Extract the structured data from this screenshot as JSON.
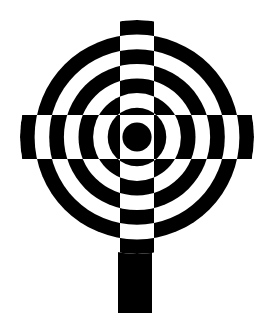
{
  "canvas": {
    "width": 278,
    "height": 313,
    "background_color": "#ffffff",
    "foreground_color": "#000000"
  },
  "figure": {
    "name": "checkerboard-target-lollipop",
    "title": "",
    "caption": ""
  },
  "disc": {
    "center_x": 137,
    "center_y": 137,
    "outer_radius": 117,
    "ring_count": 8,
    "ring_radii": [
      14.6,
      29.3,
      43.9,
      58.5,
      73.1,
      87.8,
      102.4,
      117.0
    ],
    "ring_fills": [
      "black",
      "white",
      "black",
      "white",
      "black",
      "white",
      "black",
      "white"
    ]
  },
  "bands": {
    "horizontal_band_half_height": 22,
    "vertical_band_half_width": 17,
    "horizontal_band_top": 115,
    "horizontal_band_bottom": 159,
    "vertical_band_left": 120,
    "vertical_band_right": 154
  },
  "stem": {
    "x": 118,
    "y": 245,
    "width": 34,
    "height": 68,
    "fill": "black"
  },
  "colors": {
    "black": "#000000",
    "white": "#ffffff"
  }
}
